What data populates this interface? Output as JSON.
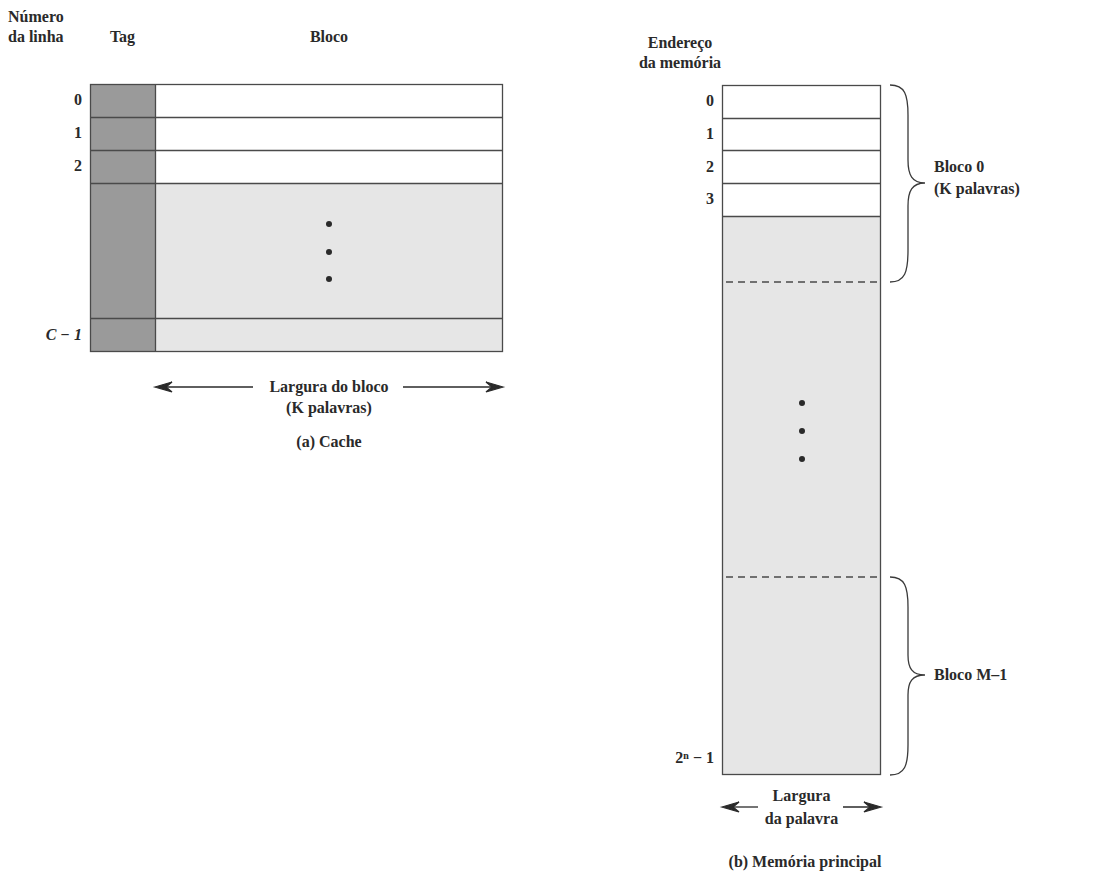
{
  "cache": {
    "header_line_number": [
      "Número",
      "da linha"
    ],
    "header_tag": "Tag",
    "header_block": "Bloco",
    "row_labels": [
      "0",
      "1",
      "2"
    ],
    "last_row_label": "C − 1",
    "width_label": "Largura do bloco",
    "width_sublabel": "(K palavras)",
    "caption": "(a) Cache",
    "colors": {
      "tag": "#9a9a9a",
      "shaded": "#e6e6e6",
      "white": "#ffffff",
      "line": "#4a4a4a"
    }
  },
  "memory": {
    "header": [
      "Endereço",
      "da memória"
    ],
    "row_labels": [
      "0",
      "1",
      "2",
      "3"
    ],
    "last_row_label": "2ⁿ − 1",
    "block0_label": "Bloco 0",
    "block0_sublabel": "(K palavras)",
    "blockM_label": "Bloco M–1",
    "width_label": "Largura",
    "width_sublabel": "da palavra",
    "caption": "(b) Memória principal"
  }
}
